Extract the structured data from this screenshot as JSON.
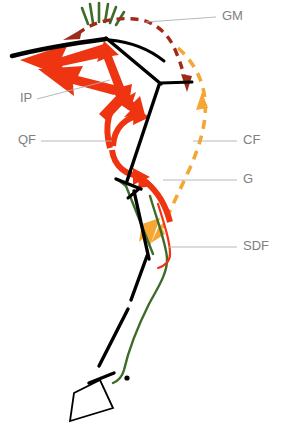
{
  "figure": {
    "type": "anatomical-diagram",
    "width": 281,
    "height": 437,
    "background": "#ffffff"
  },
  "colors": {
    "skeleton": "#000000",
    "red_arrow": "#ef3411",
    "dark_red_dashed": "#a02a18",
    "orange_dashed": "#f5a633",
    "green_muscle": "#3c6b2a",
    "label_text": "#808080",
    "leader_line": "#b0b0b0",
    "burst_green": "#3c6b2a"
  },
  "labels": [
    {
      "id": "GM",
      "text": "GM",
      "x": 222,
      "y": 17,
      "leader": "M 146 22 L 216 17",
      "color_ref": "dark_red_dashed"
    },
    {
      "id": "IP",
      "text": "IP",
      "x": 22,
      "y": 99,
      "leader": "M 36 99 L 110 80",
      "color_ref": "red_arrow"
    },
    {
      "id": "QF",
      "text": "QF",
      "x": 20,
      "y": 141,
      "leader": "M 40 141 L 112 141",
      "color_ref": "red_arrow"
    },
    {
      "id": "CF",
      "text": "CF",
      "x": 243,
      "y": 141,
      "leader": "M 192 141 L 237 141",
      "color_ref": "orange_dashed"
    },
    {
      "id": "G",
      "text": "G",
      "x": 243,
      "y": 180,
      "leader": "M 163 180 L 237 180",
      "color_ref": "green_muscle"
    },
    {
      "id": "SDF",
      "text": "SDF",
      "x": 243,
      "y": 247,
      "leader": "M 168 247 L 237 247",
      "color_ref": "green_muscle"
    }
  ],
  "legend_meaning": {
    "GM": "gastrocnemius / dark-red dashed arc",
    "IP": "iliotibialis-pubic group / thick red arrows",
    "QF": "quadriceps femoris / curved red arrows",
    "CF": "caudofemoralis / orange dashed arc",
    "G": "gastrocnemius / green muscle line",
    "SDF": "superficial digital flexor / green tendon line"
  },
  "skeleton_segments": [
    {
      "name": "synsacrum-ilium",
      "path": "M 12 56 C 40 48 76 42 106 38"
    },
    {
      "name": "pelvis-dorsal-bar",
      "path": "M 109 40 C 130 41 148 48 163 60"
    },
    {
      "name": "femur",
      "path": "M 106 38 L 160 83"
    },
    {
      "name": "ischium-pubis",
      "path": "M 160 83 L 190 82"
    },
    {
      "name": "tibiotarsus",
      "path": "M 158 84 L 128 180"
    },
    {
      "name": "fibula-short",
      "path": "M 118 178 L 140 188"
    },
    {
      "name": "tarsometatarsus-upper",
      "path": "M 140 188 L 129 196"
    },
    {
      "name": "tarsometatarsus",
      "path": "M 133 192 L 148 258"
    },
    {
      "name": "metatarsus-upper",
      "path": "M 146 255 L 131 299"
    },
    {
      "name": "metatarsus-lower",
      "path": "M 128 308 L 98 367"
    },
    {
      "name": "digit-proximal",
      "path": "M 113 373 L 88 383"
    },
    {
      "name": "toe-outline",
      "path": "M 73 394 L 99 381 L 113 408 L 70 420 Z"
    },
    {
      "name": "joint-dot",
      "cx": 127,
      "cy": 378,
      "r": 2.6
    }
  ],
  "muscle_lines": [
    {
      "name": "gastrocnemius-green-upper",
      "color_ref": "green_muscle",
      "path": "M 120 180 L 127 186"
    },
    {
      "name": "gastrocnemius-green",
      "color_ref": "green_muscle",
      "path": "M 127 186 L 152 253"
    },
    {
      "name": "sdf-green",
      "color_ref": "green_muscle",
      "path": "M 152 200 C 160 228 166 244 167 258 C 168 272 158 288 150 302 C 142 318 130 346 124 370 C 121 378 117 381 112 383"
    },
    {
      "name": "sdf-red",
      "color_ref": "red_arrow",
      "path": "M 160 208 C 166 228 170 242 170 254 C 170 262 164 266 159 268"
    }
  ],
  "red_arrows": [
    {
      "name": "ip-main-thick-arrow",
      "desc": "large thick red arrow pointing left-down from femur head"
    },
    {
      "name": "ip-secondary-arrow",
      "desc": "second thick red arrow below main"
    },
    {
      "name": "ip-up-arrow",
      "desc": "red arrow pointing up to pelvis"
    },
    {
      "name": "qf-curved-arrow-upper",
      "desc": "curved red arrow sweeping up to femur"
    },
    {
      "name": "qf-curved-arrow-lower",
      "desc": "curved red arrow sweeping right"
    },
    {
      "name": "g-curved-arrow",
      "desc": "curved red arrow along tibiotarsus"
    }
  ],
  "dashed_arcs": [
    {
      "name": "gm-arc",
      "color_ref": "dark_red_dashed",
      "desc": "dark red dashed arc over back, arrowheads at both ends"
    },
    {
      "name": "cf-arc",
      "color_ref": "orange_dashed",
      "desc": "orange dashed arc down posterior, arrowheads pointing up and down"
    }
  ],
  "burst": {
    "name": "green-burst",
    "color_ref": "burst_green",
    "ray_count": 6,
    "center_x": 99,
    "center_y": 30,
    "desc": "radiating green rays above the GM arrowhead"
  }
}
